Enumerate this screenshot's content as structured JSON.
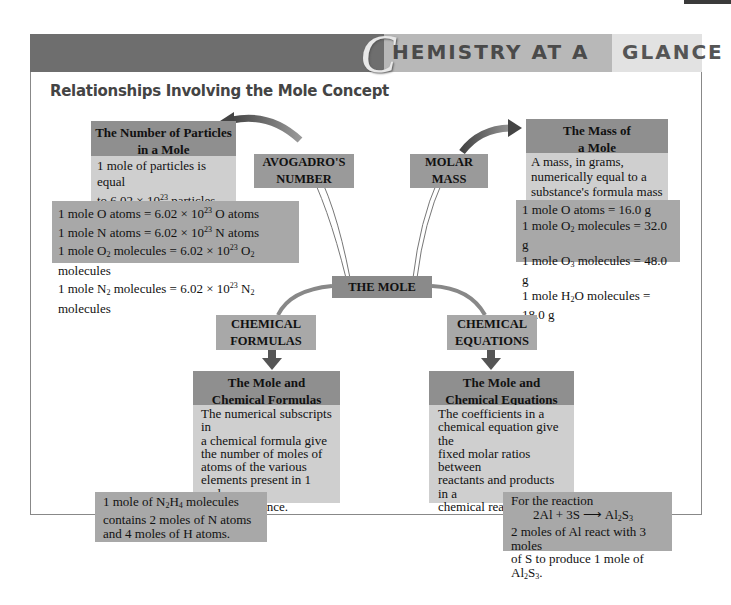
{
  "banner": {
    "initial": "C",
    "title_part1": "HEMISTRY AT A",
    "title_part2": "GLANCE"
  },
  "subtitle": "Relationships Involving the Mole Concept",
  "center": {
    "label": "THE MOLE"
  },
  "connectors": {
    "avogadro": {
      "line1": "AVOGADRO'S",
      "line2": "NUMBER"
    },
    "molar_mass": {
      "line1": "MOLAR",
      "line2": "MASS"
    },
    "chemical_formulas": {
      "line1": "CHEMICAL",
      "line2": "FORMULAS"
    },
    "chemical_equations": {
      "line1": "CHEMICAL",
      "line2": "EQUATIONS"
    }
  },
  "particles": {
    "title_line1": "The Number of Particles",
    "title_line2": "in a Mole",
    "desc_line1": "1 mole of particles is equal",
    "desc_line2_pre": "to 6.02 × 10",
    "desc_line2_exp": "23",
    "desc_line2_post": " particles.",
    "examples": [
      "1 mole O atoms = 6.02 × 10^23 O atoms",
      "1 mole N atoms = 6.02 × 10^23 N atoms",
      "1 mole O2 molecules = 6.02 × 10^23 O2 molecules",
      "1 mole N2 molecules = 6.02 × 10^23 N2 molecules"
    ]
  },
  "mass": {
    "title_line1": "The Mass of",
    "title_line2": "a Mole",
    "desc_line1": "A mass, in grams,",
    "desc_line2": "numerically equal to a",
    "desc_line3": "substance's formula mass",
    "examples": [
      "1 mole O atoms = 16.0 g",
      "1 mole O2 molecules = 32.0 g",
      "1 mole O3 molecules = 48.0 g",
      "1 mole H2O molecules = 18.0 g"
    ]
  },
  "formulas": {
    "title_line1": "The Mole and",
    "title_line2": "Chemical Formulas",
    "desc_lines": [
      "The numerical subscripts in",
      "a chemical formula give",
      "the number of moles of",
      "atoms of the various",
      "elements present in 1 mole",
      "of the substance."
    ],
    "example": "1 mole of N2H4 molecules contains 2 moles of N atoms and 4 moles of H atoms."
  },
  "equations": {
    "title_line1": "The Mole and",
    "title_line2": "Chemical Equations",
    "desc_lines": [
      "The coefficients in a",
      "chemical equation give the",
      "fixed molar ratios between",
      "reactants and products in a",
      "chemical reaction."
    ],
    "example_intro": "For the reaction",
    "reaction_left": "2Al + 3S",
    "reaction_right": "Al2S3",
    "example_text": "2 moles of Al react with 3 moles of S to produce 1 mole of Al2S3."
  }
}
